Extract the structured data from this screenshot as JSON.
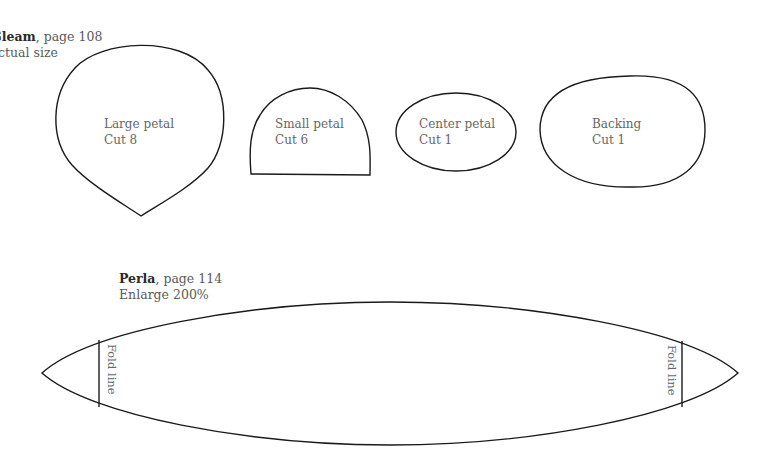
{
  "gleam": {
    "name": "Gleam",
    "page": ", page 108",
    "scale": "Actual size",
    "pieces": [
      {
        "name": "Large petal",
        "cut": "Cut 8"
      },
      {
        "name": "Small petal",
        "cut": "Cut 6"
      },
      {
        "name": "Center petal",
        "cut": "Cut 1"
      },
      {
        "name": "Backing",
        "cut": "Cut 1"
      }
    ]
  },
  "perla": {
    "name": "Perla",
    "page": ", page 114",
    "scale": "Enlarge 200%",
    "fold_left": "Fold line",
    "fold_right": "Fold line"
  }
}
